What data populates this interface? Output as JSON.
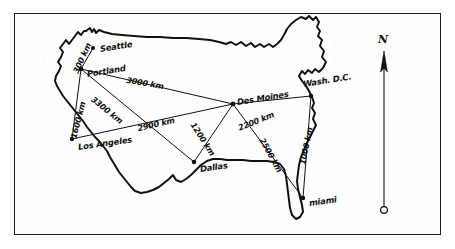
{
  "figure": {
    "ink_color": "#111111",
    "background_color": "#ffffff",
    "frame_color": "#1a1a1a"
  },
  "cities": [
    {
      "name": "Seattle",
      "x": 93,
      "y": 48,
      "label_dx": 7,
      "label_dy": -3,
      "rotate": -9
    },
    {
      "name": "Portland",
      "x": 81,
      "y": 69,
      "label_dx": 6,
      "label_dy": 1,
      "rotate": -9
    },
    {
      "name": "Los Angeles",
      "x": 72,
      "y": 139,
      "label_dx": 6,
      "label_dy": 4,
      "rotate": -8
    },
    {
      "name": "Des Moines",
      "x": 233,
      "y": 104,
      "label_dx": 4,
      "label_dy": -6,
      "rotate": -9
    },
    {
      "name": "Dallas",
      "x": 194,
      "y": 162,
      "label_dx": 6,
      "label_dy": 3,
      "rotate": -8
    },
    {
      "name": "Wash. D.C.",
      "x": 311,
      "y": 96,
      "label_dx": -8,
      "label_dy": -16,
      "rotate": -9
    },
    {
      "name": "miami",
      "x": 303,
      "y": 198,
      "label_dx": 6,
      "label_dy": 1,
      "rotate": -8
    }
  ],
  "routes": [
    {
      "from": "Seattle",
      "to": "Portland",
      "label": "300 km",
      "lx": 82,
      "ly": 58,
      "rotate": -66
    },
    {
      "from": "Portland",
      "to": "Des Moines",
      "label": "3000 km",
      "lx": 145,
      "ly": 83,
      "rotate": 10
    },
    {
      "from": "Portland",
      "to": "Los Angeles",
      "label": "1600 km",
      "lx": 78,
      "ly": 120,
      "rotate": -76
    },
    {
      "from": "Portland",
      "to": "Dallas",
      "label": "3300 km",
      "lx": 107,
      "ly": 110,
      "rotate": 39
    },
    {
      "from": "Los Angeles",
      "to": "Des Moines",
      "label": "2900 km",
      "lx": 156,
      "ly": 124,
      "rotate": -13
    },
    {
      "from": "Des Moines",
      "to": "Dallas",
      "label": "1200 km",
      "lx": 203,
      "ly": 139,
      "rotate": 57
    },
    {
      "from": "Des Moines",
      "to": "Wash. D.C.",
      "label": "2200 km",
      "lx": 256,
      "ly": 121,
      "rotate": -22
    },
    {
      "from": "Des Moines",
      "to": "miami",
      "label": "2500 km",
      "lx": 271,
      "ly": 155,
      "rotate": 61
    },
    {
      "from": "Wash. D.C.",
      "to": "miami",
      "label": "1000 km",
      "lx": 306,
      "ly": 146,
      "rotate": -79
    }
  ],
  "compass": {
    "label": "N",
    "label_x": 380,
    "label_y": 41,
    "arrow_x": 384,
    "arrow_top_y": 52,
    "arrow_base_y": 212
  }
}
